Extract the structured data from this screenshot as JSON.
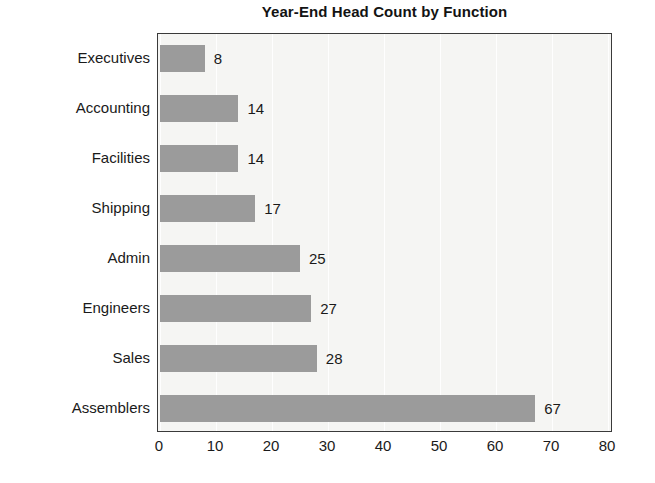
{
  "chart_data": {
    "type": "bar",
    "orientation": "horizontal",
    "title": "Year-End Head Count by Function",
    "xlabel": "",
    "ylabel": "",
    "categories": [
      "Executives",
      "Accounting",
      "Facilities",
      "Shipping",
      "Admin",
      "Engineers",
      "Sales",
      "Assemblers"
    ],
    "values": [
      8,
      14,
      14,
      17,
      25,
      27,
      28,
      67
    ],
    "data_labels": [
      "8",
      "14",
      "14",
      "17",
      "25",
      "27",
      "28",
      "67"
    ],
    "xlim": [
      0,
      80
    ],
    "xticks": [
      0,
      10,
      20,
      30,
      40,
      50,
      60,
      70,
      80
    ],
    "xtick_labels": [
      "0",
      "10",
      "20",
      "30",
      "40",
      "50",
      "60",
      "70",
      "80"
    ],
    "grid": true,
    "grid_axis": "x",
    "legend": false,
    "legend_position": "none",
    "colors": {
      "bar_fill": "#9b9b9b",
      "plot_background": "#f5f5f3",
      "page_background": "#ffffff",
      "axis_border": "#3a3a3a",
      "gridline": "#ffffff",
      "text": "#1a1a1a",
      "title_text": "#131313"
    }
  }
}
